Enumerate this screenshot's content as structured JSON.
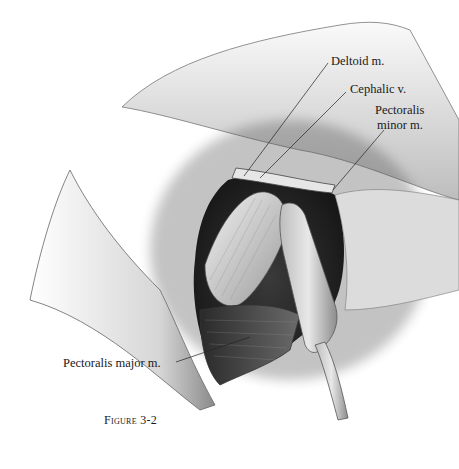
{
  "figure": {
    "caption": "Figure 3-2",
    "labels": {
      "deltoid": "Deltoid m.",
      "cephalic": "Cephalic v.",
      "pec_minor_line1": "Pectoralis",
      "pec_minor_line2": "minor m.",
      "pec_major": "Pectoralis major m."
    }
  }
}
